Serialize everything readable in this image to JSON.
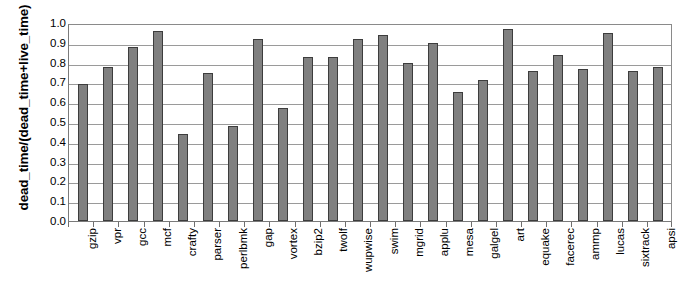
{
  "chart_data": {
    "type": "bar",
    "title": "",
    "xlabel": "",
    "ylabel": "dead_time/(dead_time+live_time)",
    "ylim": [
      0.0,
      1.0
    ],
    "grid": true,
    "legend": "none",
    "bar_color": "#808080",
    "bar_edge_color": "#3d3d3d",
    "yticks": [
      "1.0",
      "0.9",
      "0.8",
      "0.7",
      "0.6",
      "0.5",
      "0.4",
      "0.3",
      "0.2",
      "0.1",
      "0.0"
    ],
    "ytick_values": [
      1.0,
      0.9,
      0.8,
      0.7,
      0.6,
      0.5,
      0.4,
      0.3,
      0.2,
      0.1,
      0.0
    ],
    "categories": [
      "gzip",
      "vpr",
      "gcc",
      "mcf",
      "crafty",
      "parser",
      "perlbmk",
      "gap",
      "vortex",
      "bzip2",
      "twolf",
      "wupwise",
      "swim",
      "mgrid",
      "applu",
      "mesa",
      "galgel",
      "art",
      "equake",
      "facerec",
      "ammp",
      "lucas",
      "sixtrack",
      "apsi"
    ],
    "values": [
      0.69,
      0.78,
      0.88,
      0.96,
      0.44,
      0.75,
      0.48,
      0.92,
      0.57,
      0.83,
      0.83,
      0.92,
      0.94,
      0.8,
      0.9,
      0.65,
      0.71,
      0.97,
      0.76,
      0.84,
      0.77,
      0.95,
      0.76,
      0.78
    ]
  }
}
